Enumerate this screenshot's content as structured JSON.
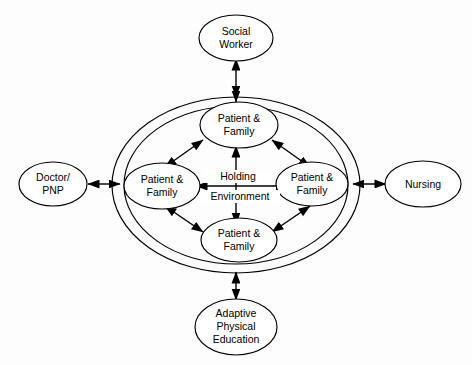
{
  "diagram": {
    "background_color": "#fdfdfd",
    "line_color": "#000000",
    "shape_fill": "#ffffff",
    "center": {
      "label_line1": "Holding",
      "label_line2": "Environment"
    },
    "inner_nodes": [
      {
        "id": "patient-family-top",
        "line1": "Patient &",
        "line2": "Family",
        "position": "top"
      },
      {
        "id": "patient-family-left",
        "line1": "Patient &",
        "line2": "Family",
        "position": "left"
      },
      {
        "id": "patient-family-right",
        "line1": "Patient &",
        "line2": "Family",
        "position": "right"
      },
      {
        "id": "patient-family-bottom",
        "line1": "Patient &",
        "line2": "Family",
        "position": "bottom"
      }
    ],
    "outer_nodes": [
      {
        "id": "social-worker",
        "line1": "Social",
        "line2": "Worker",
        "line3": "",
        "position": "top"
      },
      {
        "id": "doctor-pnp",
        "line1": "Doctor/",
        "line2": "PNP",
        "line3": "",
        "position": "left"
      },
      {
        "id": "nursing",
        "line1": "Nursing",
        "line2": "",
        "line3": "",
        "position": "right"
      },
      {
        "id": "adaptive-physical-education",
        "line1": "Adaptive",
        "line2": "Physical",
        "line3": "Education",
        "position": "bottom"
      }
    ],
    "connectors": [
      {
        "id": "social-worker-to-holding",
        "type": "double-arrow",
        "orientation": "vertical"
      },
      {
        "id": "doctor-pnp-to-holding",
        "type": "double-arrow",
        "orientation": "horizontal"
      },
      {
        "id": "nursing-to-holding",
        "type": "double-arrow",
        "orientation": "horizontal"
      },
      {
        "id": "ape-to-holding",
        "type": "double-arrow",
        "orientation": "vertical"
      },
      {
        "id": "top-to-left",
        "type": "double-arrow",
        "orientation": "diagonal"
      },
      {
        "id": "top-to-right",
        "type": "double-arrow",
        "orientation": "diagonal"
      },
      {
        "id": "bottom-to-left",
        "type": "double-arrow",
        "orientation": "diagonal"
      },
      {
        "id": "bottom-to-right",
        "type": "double-arrow",
        "orientation": "diagonal"
      },
      {
        "id": "left-to-right-center",
        "type": "double-arrow",
        "orientation": "horizontal"
      },
      {
        "id": "top-to-bottom-center",
        "type": "double-arrow",
        "orientation": "vertical"
      }
    ]
  }
}
